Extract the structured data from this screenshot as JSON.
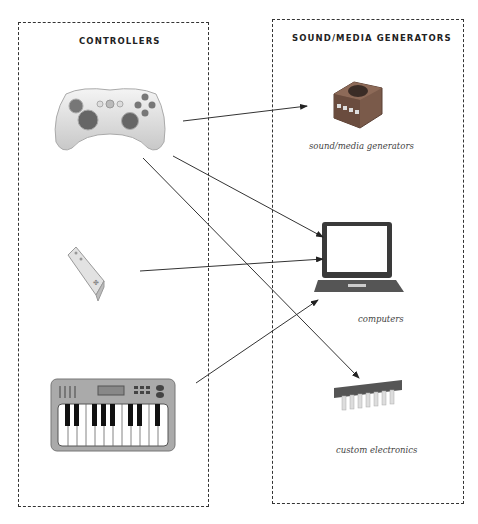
{
  "diagram": {
    "left_panel": {
      "title": "CONTROLLERS",
      "items": [
        {
          "name": "game controller",
          "icon": "gamepad-icon"
        },
        {
          "name": "wii remote",
          "icon": "wii-remote-icon"
        },
        {
          "name": "midi keyboard",
          "icon": "keyboard-synth-icon"
        }
      ]
    },
    "right_panel": {
      "title": "SOUND/MEDIA GENERATORS",
      "items": [
        {
          "name": "console",
          "icon": "game-console-icon",
          "caption": "sound/media generators"
        },
        {
          "name": "laptop",
          "icon": "laptop-icon",
          "caption": "computers"
        },
        {
          "name": "chip",
          "icon": "microchip-icon",
          "caption": "custom electronics"
        }
      ]
    },
    "arrows": [
      {
        "from": "game controller",
        "to": "console"
      },
      {
        "from": "game controller",
        "to": "laptop"
      },
      {
        "from": "game controller",
        "to": "chip"
      },
      {
        "from": "wii remote",
        "to": "laptop"
      },
      {
        "from": "midi keyboard",
        "to": "laptop"
      }
    ],
    "footer_text": "— — ——— —— —— ———— —— ———"
  },
  "colors": {
    "console": "#7a5a4a",
    "laptop": "#3a3a3a",
    "chip": "#555555",
    "line": "#333333"
  }
}
